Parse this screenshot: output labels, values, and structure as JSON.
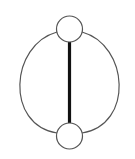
{
  "diagram": {
    "type": "graph",
    "nodes": [
      {
        "id": "top",
        "cx": 69.5,
        "cy": 29,
        "r": 13
      },
      {
        "id": "bottom",
        "cx": 69.5,
        "cy": 136,
        "r": 13
      }
    ],
    "edges": [
      {
        "from": "top",
        "to": "bottom",
        "style": "thick-straight",
        "stroke_width": 3.2
      },
      {
        "from": "top",
        "to": "bottom",
        "style": "curved-left",
        "stroke_width": 1.2
      },
      {
        "from": "top",
        "to": "bottom",
        "style": "curved-right",
        "stroke_width": 1.2
      }
    ],
    "colors": {
      "stroke": "#555555",
      "thick_edge": "#111111",
      "node_fill": "#ffffff",
      "background": "#ffffff"
    }
  }
}
